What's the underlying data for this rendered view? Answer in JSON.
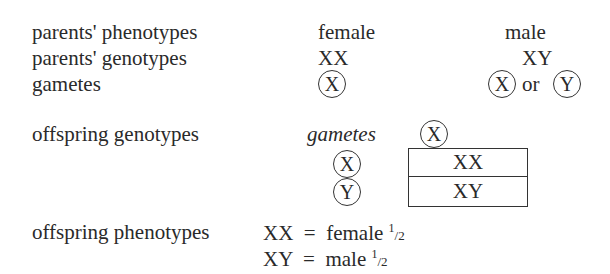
{
  "rows": {
    "phenotypes": {
      "label": "parents' phenotypes",
      "female": "female",
      "male": "male"
    },
    "genotypes": {
      "label": "parents' genotypes",
      "female": "XX",
      "male": "XY"
    },
    "gametes": {
      "label": "gametes",
      "female": "X",
      "male_1": "X",
      "male_or": "or",
      "male_2": "Y"
    }
  },
  "offspring_genotypes": {
    "label": "offspring genotypes",
    "gametes_label": "gametes",
    "column_gamete": "X",
    "row_gametes": [
      "X",
      "Y"
    ],
    "cells": [
      "XX",
      "XY"
    ]
  },
  "offspring_phenotypes": {
    "label": "offspring phenotypes",
    "items": [
      {
        "genotype": "XX",
        "eq": "=",
        "phenotype": "female",
        "num": "1",
        "den": "2"
      },
      {
        "genotype": "XY",
        "eq": "=",
        "phenotype": "male",
        "num": "1",
        "den": "2"
      }
    ]
  }
}
